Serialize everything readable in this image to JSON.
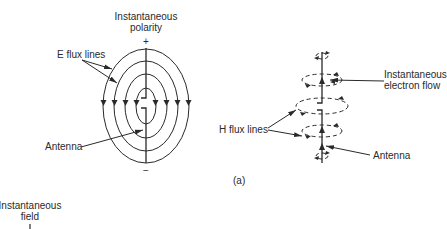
{
  "figure": {
    "panel_label": "(a)",
    "e_field_diagram": {
      "title_line1": "Instantaneous",
      "title_line2": "polarity",
      "top_sign": "+",
      "bottom_sign": "−",
      "e_flux_label": "E flux lines",
      "antenna_label": "Antenna",
      "ellipse_count": 4
    },
    "h_field_diagram": {
      "electron_flow_line1": "Instantaneous",
      "electron_flow_line2": "electron flow",
      "h_flux_label": "H flux lines",
      "antenna_label": "Antenna",
      "loop_count": 6
    },
    "bottom_partial": {
      "label_line1": "Instantaneous",
      "label_line2": "field",
      "marker": "I"
    }
  },
  "colors": {
    "line": "#2a2a2a",
    "background": "#ffffff"
  }
}
